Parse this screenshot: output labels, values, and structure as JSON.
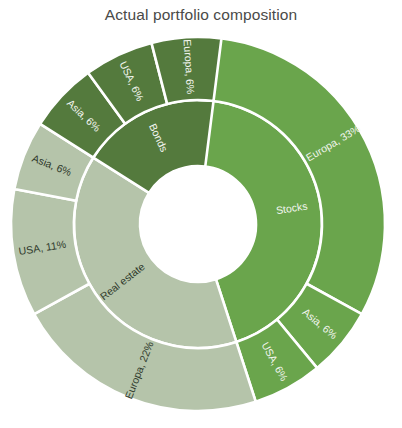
{
  "chart": {
    "title": "Actual portfolio composition"
  },
  "chart_data": {
    "type": "pie",
    "subtype": "sunburst",
    "title": "Actual portfolio composition",
    "xlabel": "",
    "ylabel": "",
    "grid": false,
    "legend": false,
    "legend_position": "none",
    "units": "percent",
    "total": 100,
    "hole_ratio": 0.31,
    "start_angle_deg": 0,
    "direction": "clockwise",
    "colors": {
      "stocks": "#6aa54c",
      "real_estate": "#b5c4aa",
      "bonds": "#547a3d",
      "divider": "#ffffff",
      "title": "#4a4a48",
      "background": "#ffffff",
      "label_light": "#f2f5ef",
      "label_dark": "#2f3a2c"
    },
    "rings": [
      {
        "name": "category",
        "level": 1,
        "segments": [
          {
            "label": "Stocks",
            "value": 45,
            "color": "#6aa54c",
            "label_text": "Stocks",
            "label_color": "#f2f5ef"
          },
          {
            "label": "Real estate",
            "value": 39,
            "color": "#b5c4aa",
            "label_text": "Real estate",
            "label_color": "#2f3a2c"
          },
          {
            "label": "Bonds",
            "value": 18,
            "color": "#547a3d",
            "label_text": "Bonds",
            "label_color": "#f2f5ef"
          }
        ]
      },
      {
        "name": "region",
        "level": 2,
        "segments": [
          {
            "parent": "Stocks",
            "label": "Europa",
            "value": 33,
            "color": "#6aa54c",
            "label_text": "Europa, 33%",
            "label_color": "#f2f5ef"
          },
          {
            "parent": "Stocks",
            "label": "Asia",
            "value": 6,
            "color": "#6aa54c",
            "label_text": "Asia, 6%",
            "label_color": "#f2f5ef"
          },
          {
            "parent": "Stocks",
            "label": "USA",
            "value": 6,
            "color": "#6aa54c",
            "label_text": "USA, 6%",
            "label_color": "#f2f5ef"
          },
          {
            "parent": "Real estate",
            "label": "Europa",
            "value": 22,
            "color": "#b5c4aa",
            "label_text": "Europa, 22%",
            "label_color": "#2f3a2c"
          },
          {
            "parent": "Real estate",
            "label": "USA",
            "value": 11,
            "color": "#b5c4aa",
            "label_text": "USA, 11%",
            "label_color": "#2f3a2c"
          },
          {
            "parent": "Real estate",
            "label": "Asia",
            "value": 6,
            "color": "#b5c4aa",
            "label_text": "Asia, 6%",
            "label_color": "#2f3a2c"
          },
          {
            "parent": "Bonds",
            "label": "Asia",
            "value": 6,
            "color": "#547a3d",
            "label_text": "Asia, 6%",
            "label_color": "#f2f5ef"
          },
          {
            "parent": "Bonds",
            "label": "USA",
            "value": 6,
            "color": "#547a3d",
            "label_text": "USA, 6%",
            "label_color": "#f2f5ef"
          },
          {
            "parent": "Bonds",
            "label": "Europa",
            "value": 6,
            "color": "#547a3d",
            "label_text": "Europa, 6%",
            "label_color": "#f2f5ef"
          }
        ]
      }
    ],
    "categories": [
      "Stocks",
      "Real estate",
      "Bonds"
    ],
    "values": [
      45,
      39,
      18
    ],
    "series": [
      {
        "name": "Europa",
        "values": [
          33,
          22,
          6
        ]
      },
      {
        "name": "USA",
        "values": [
          6,
          11,
          6
        ]
      },
      {
        "name": "Asia",
        "values": [
          6,
          6,
          6
        ]
      }
    ]
  },
  "geometry": {
    "center_x": 198,
    "center_y": 224,
    "inner_radius": 58,
    "mid_radius": 124,
    "outer_radius": 187
  }
}
